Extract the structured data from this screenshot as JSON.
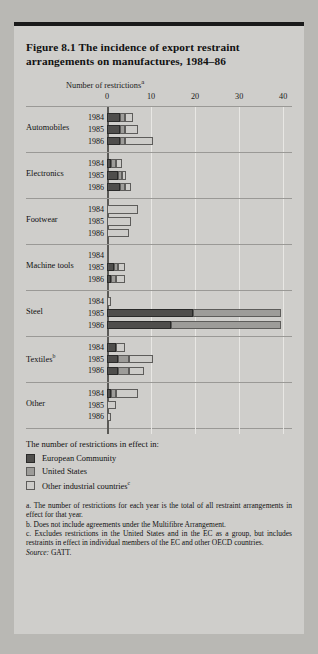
{
  "figure": {
    "title": "Figure 8.1  The incidence of export restraint arrangements on manufactures, 1984–86",
    "axis_title": "Number of restrictions",
    "axis_title_sup": "a"
  },
  "legend": {
    "title": "The number of restrictions in effect in:",
    "items": [
      {
        "key": "ec",
        "label": "European Community",
        "sup": "",
        "color": "#4f4e4c"
      },
      {
        "key": "us",
        "label": "United States",
        "sup": "",
        "color": "#9d9c99"
      },
      {
        "key": "other",
        "label": "Other industrial countries",
        "sup": "c",
        "color": "#cdccc9"
      }
    ]
  },
  "notes": [
    "a. The number of restrictions for each year is the total of all restraint arrangements in effect for that year.",
    "b. Does not include agreements under the Multifibre Arrangement.",
    "c. Excludes restrictions in the United States and in the EC as a group, but includes restraints in effect in individual members of the EC and other OECD countries."
  ],
  "source": "Source: GATT.",
  "source_prefix": "Source:",
  "source_value": "GATT.",
  "chart_data": {
    "type": "bar",
    "orientation": "horizontal",
    "stacked": true,
    "title": "Figure 8.1  The incidence of export restraint arrangements on manufactures, 1984–86",
    "xlabel": "Number of restrictions",
    "ylabel": "",
    "xlim": [
      0,
      42
    ],
    "ticks": [
      0,
      10,
      20,
      30,
      40
    ],
    "grid": true,
    "legend_position": "below",
    "series": [
      {
        "name": "European Community",
        "key": "ec",
        "color": "#4f4e4c"
      },
      {
        "name": "United States",
        "key": "us",
        "color": "#9d9c99"
      },
      {
        "name": "Other industrial countries",
        "key": "other",
        "color": "#cdccc9"
      }
    ],
    "groups": [
      {
        "category": "Automobiles",
        "sup": "",
        "bars": [
          {
            "year": "1984",
            "ec": 3.0,
            "us": 1.0,
            "other": 2.0,
            "total": 6.0
          },
          {
            "year": "1985",
            "ec": 3.0,
            "us": 1.0,
            "other": 3.0,
            "total": 7.0
          },
          {
            "year": "1986",
            "ec": 3.0,
            "us": 1.0,
            "other": 6.5,
            "total": 10.5
          }
        ]
      },
      {
        "category": "Electronics",
        "sup": "",
        "bars": [
          {
            "year": "1984",
            "ec": 1.0,
            "us": 1.0,
            "other": 1.5,
            "total": 3.5
          },
          {
            "year": "1985",
            "ec": 2.5,
            "us": 1.0,
            "other": 0.8,
            "total": 4.3
          },
          {
            "year": "1986",
            "ec": 3.0,
            "us": 1.0,
            "other": 1.5,
            "total": 5.5
          }
        ]
      },
      {
        "category": "Footwear",
        "sup": "",
        "bars": [
          {
            "year": "1984",
            "ec": 0,
            "us": 0,
            "other": 7.0,
            "total": 7.0
          },
          {
            "year": "1985",
            "ec": 0,
            "us": 0,
            "other": 5.5,
            "total": 5.5
          },
          {
            "year": "1986",
            "ec": 0,
            "us": 0,
            "other": 5.0,
            "total": 5.0
          }
        ]
      },
      {
        "category": "Machine tools",
        "sup": "",
        "bars": [
          {
            "year": "1984",
            "ec": 0,
            "us": 0,
            "other": 0,
            "total": 0
          },
          {
            "year": "1985",
            "ec": 1.5,
            "us": 1.0,
            "other": 1.5,
            "total": 4.0
          },
          {
            "year": "1986",
            "ec": 1.0,
            "us": 1.0,
            "other": 2.0,
            "total": 4.0
          }
        ]
      },
      {
        "category": "Steel",
        "sup": "",
        "bars": [
          {
            "year": "1984",
            "ec": 0,
            "us": 0,
            "other": 1.0,
            "total": 1.0
          },
          {
            "year": "1985",
            "ec": 19.5,
            "us": 20.0,
            "other": 0,
            "total": 39.5
          },
          {
            "year": "1986",
            "ec": 14.5,
            "us": 25.0,
            "other": 0,
            "total": 39.5
          }
        ]
      },
      {
        "category": "Textiles",
        "sup": "b",
        "bars": [
          {
            "year": "1984",
            "ec": 2.0,
            "us": 0,
            "other": 2.0,
            "total": 4.0
          },
          {
            "year": "1985",
            "ec": 2.5,
            "us": 2.5,
            "other": 5.5,
            "total": 10.5
          },
          {
            "year": "1986",
            "ec": 2.5,
            "us": 2.5,
            "other": 3.5,
            "total": 8.5
          }
        ]
      },
      {
        "category": "Other",
        "sup": "",
        "bars": [
          {
            "year": "1984",
            "ec": 1.0,
            "us": 1.0,
            "other": 5.0,
            "total": 7.0
          },
          {
            "year": "1985",
            "ec": 0,
            "us": 0,
            "other": 2.0,
            "total": 2.0
          },
          {
            "year": "1986",
            "ec": 0,
            "us": 0,
            "other": 1.0,
            "total": 1.0
          }
        ]
      }
    ]
  }
}
